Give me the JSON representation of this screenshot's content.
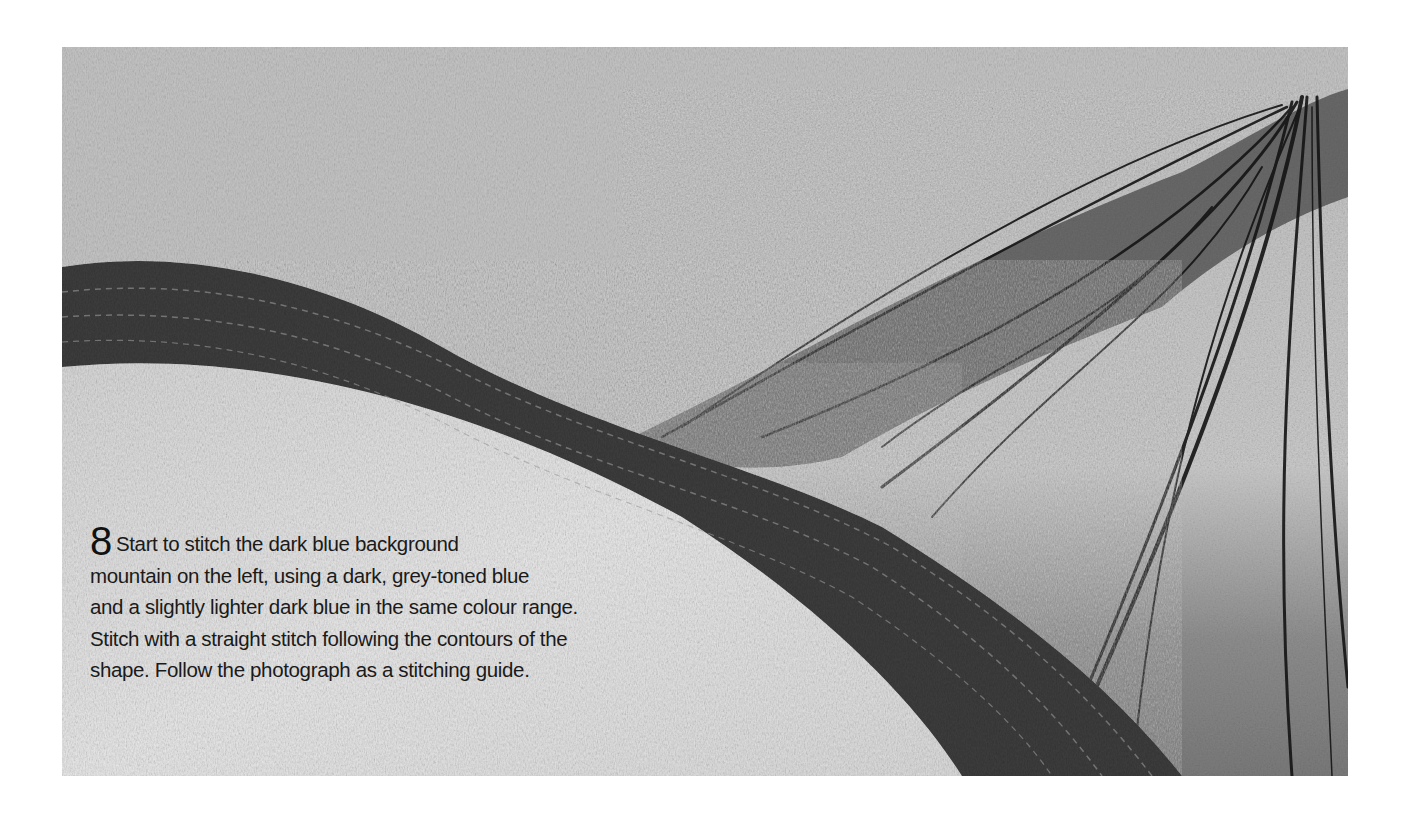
{
  "figure": {
    "colors": {
      "sky": "#c4c4c4",
      "dark_mountain": "#3b3b3b",
      "foreground": "#e4e4e4",
      "peak_lines": "#151515",
      "right_slope": "#a8a8a8"
    }
  },
  "caption": {
    "step_number": "8",
    "lines": [
      "Start to stitch the dark blue background",
      "mountain on the left, using a dark, grey-toned blue",
      "and a slightly lighter dark blue in the same colour range.",
      "Stitch with a straight stitch following the contours of the",
      "shape. Follow the photograph as a stitching guide."
    ]
  }
}
